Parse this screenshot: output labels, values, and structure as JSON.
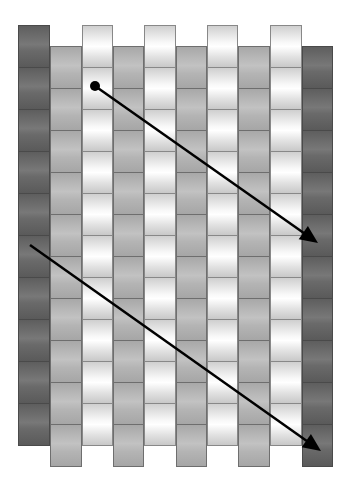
{
  "diagram": {
    "tile_height": 42,
    "columns": [
      {
        "x": 18,
        "width": 32,
        "tone": "dark",
        "top": 25,
        "tiles": 10
      },
      {
        "x": 50,
        "width": 32,
        "tone": "gray",
        "top": 46,
        "tiles": 10
      },
      {
        "x": 82,
        "width": 31,
        "tone": "white",
        "top": 25,
        "tiles": 10
      },
      {
        "x": 113,
        "width": 31,
        "tone": "gray",
        "top": 46,
        "tiles": 10
      },
      {
        "x": 144,
        "width": 32,
        "tone": "white",
        "top": 25,
        "tiles": 10
      },
      {
        "x": 176,
        "width": 31,
        "tone": "gray",
        "top": 46,
        "tiles": 10
      },
      {
        "x": 207,
        "width": 31,
        "tone": "white",
        "top": 25,
        "tiles": 10
      },
      {
        "x": 238,
        "width": 32,
        "tone": "gray",
        "top": 46,
        "tiles": 10
      },
      {
        "x": 270,
        "width": 32,
        "tone": "white",
        "top": 25,
        "tiles": 10
      },
      {
        "x": 302,
        "width": 31,
        "tone": "dark",
        "top": 46,
        "tiles": 10
      }
    ],
    "arrows": [
      {
        "name": "upper-arrow",
        "from": [
          95,
          86
        ],
        "to": [
          318,
          243
        ],
        "start_dot": true,
        "color": "#000000"
      },
      {
        "name": "lower-arrow",
        "from": [
          30,
          245
        ],
        "to": [
          321,
          451
        ],
        "start_dot": false,
        "color": "#000000"
      }
    ],
    "colors": {
      "dark": "#666666",
      "gray": "#b4b4b4",
      "white": "#f4f4f4",
      "arrow": "#000000",
      "background": "#ffffff"
    }
  }
}
